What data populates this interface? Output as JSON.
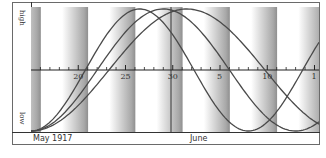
{
  "chart_data": {
    "type": "line",
    "title": "",
    "ylabel_top": "high",
    "ylabel_bottom": "low",
    "xlabel_left": "May 1917",
    "xlabel_mid": "June",
    "x_tick_labels": [
      "20",
      "25",
      "30",
      "5",
      "10",
      "1"
    ],
    "x_tick_positions_day_index": [
      5,
      10,
      15,
      20,
      25,
      30
    ],
    "x_start_label": "15 May 1917",
    "month_divider_after": "30",
    "ylim": [
      -1,
      1
    ],
    "grid": false,
    "legend": null,
    "shaded_bands": "alternating gradient bands every 5 days",
    "series": [
      {
        "name": "curve-1",
        "period_days": 23,
        "start_phase": "low",
        "peak_near": "26 May",
        "trough_near": "6 Jun"
      },
      {
        "name": "curve-2",
        "period_days": 28,
        "start_phase": "low",
        "peak_near": "28 May",
        "trough_near": "10 Jun"
      },
      {
        "name": "curve-3",
        "period_days": 33,
        "start_phase": "low",
        "peak_near": "31 May",
        "trough_near": "15 Jun"
      }
    ]
  },
  "labels": {
    "high": "high",
    "low": "low",
    "month_left": "May 1917",
    "month_mid": "June",
    "ticks": [
      "20",
      "25",
      "30",
      "5",
      "10",
      "1"
    ]
  },
  "colors": {
    "curve": "#4a4a4a",
    "axis": "#333333",
    "band_dark": "#9a9a9a",
    "background": "#ffffff"
  }
}
